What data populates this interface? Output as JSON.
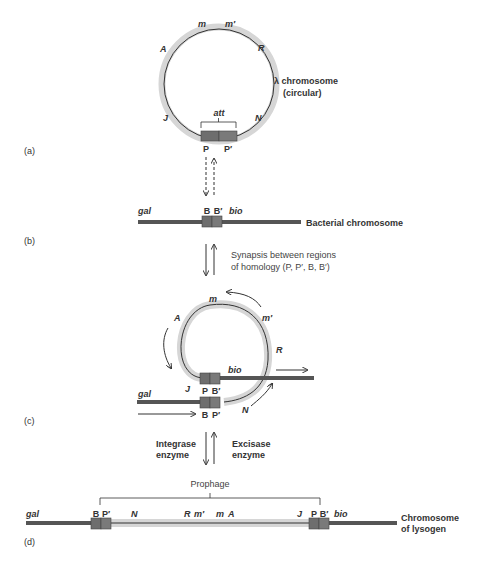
{
  "colors": {
    "dna_dark": "#555555",
    "phage_shell": "#d6d6d6",
    "phage_line": "#333333",
    "site_box": "#6e6e6e",
    "text": "#333333",
    "arrow": "#333333"
  },
  "panel_a": {
    "label": "(a)",
    "genes": {
      "m": "m",
      "m_prime": "m′",
      "A": "A",
      "R": "R",
      "J": "J",
      "N": "N"
    },
    "att_label": "att",
    "sites": {
      "P": "P",
      "P_prime": "P′"
    },
    "chromosome_label_line1": "λ chromosome",
    "chromosome_label_line2": "(circular)"
  },
  "panel_b": {
    "label": "(b)",
    "gene_left": "gal",
    "gene_right": "bio",
    "sites": {
      "B": "B",
      "B_prime": "B′"
    },
    "chromosome_label": "Bacterial chromosome",
    "synapsis_line1": "Synapsis between regions",
    "synapsis_line2": "of  homology (P, P′, B, B′)"
  },
  "panel_c": {
    "label": "(c)",
    "genes": {
      "m": "m",
      "m_prime": "m′",
      "A": "A",
      "R": "R",
      "J": "J",
      "N": "N",
      "gal": "gal",
      "bio": "bio"
    },
    "upper_sites": {
      "P": "P",
      "B_prime": "B′"
    },
    "lower_sites": {
      "B": "B",
      "P_prime": "P′"
    },
    "integrase_line1": "Integrase",
    "integrase_line2": "enzyme",
    "excisase_line1": "Excisase",
    "excisase_line2": "enzyme"
  },
  "panel_d": {
    "label": "(d)",
    "prophage_label": "Prophage",
    "gene_left": "gal",
    "gene_right": "bio",
    "left_sites": {
      "B": "B",
      "P_prime": "P′"
    },
    "right_sites": {
      "P": "P",
      "B_prime": "B′"
    },
    "genes": {
      "N": "N",
      "R": "R",
      "m_prime": "m′",
      "m": "m",
      "A": "A",
      "J": "J"
    },
    "chromosome_label_line1": "Chromosome",
    "chromosome_label_line2": "of lysogen"
  }
}
